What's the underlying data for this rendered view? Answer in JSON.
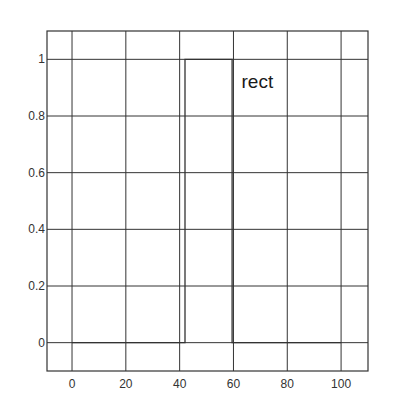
{
  "chart_data": {
    "type": "line",
    "title": "",
    "xlabel": "",
    "ylabel": "",
    "xlim": [
      -9.3,
      110
    ],
    "ylim": [
      -0.1,
      1.1
    ],
    "grid": true,
    "x_ticks": [
      0,
      20,
      40,
      60,
      80,
      100
    ],
    "x_tick_labels": [
      "0",
      "20",
      "40",
      "60",
      "80",
      "100"
    ],
    "y_ticks": [
      0,
      0.2,
      0.4,
      0.6,
      0.8,
      1
    ],
    "y_tick_labels": [
      "0",
      "0.2",
      "0.4",
      "0.6",
      "0.8",
      "1"
    ],
    "series": [
      {
        "name": "rect",
        "x": [
          0,
          42,
          42,
          59.5,
          59.5,
          100
        ],
        "y": [
          0,
          0,
          1,
          1,
          0,
          0
        ]
      }
    ],
    "annotations": [
      {
        "text": "rect",
        "x": 63,
        "y": 0.9
      }
    ],
    "colors": {
      "line": "#333333",
      "grid": "#333333",
      "frame": "#333333"
    }
  }
}
